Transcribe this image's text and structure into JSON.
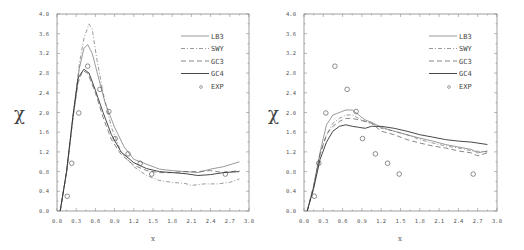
{
  "chart_data": [
    {
      "type": "line",
      "title": "",
      "xlabel": "x",
      "ylabel": "χ",
      "xlim": [
        0.0,
        3.0
      ],
      "ylim": [
        0.0,
        4.0
      ],
      "x_ticks": [
        "0.0",
        "0.3",
        "0.6",
        "0.9",
        "1.2",
        "1.5",
        "1.8",
        "2.1",
        "2.4",
        "2.7",
        "3.0"
      ],
      "y_ticks": [
        "0.0",
        "0.4",
        "0.8",
        "1.2",
        "1.6",
        "2.0",
        "2.4",
        "2.8",
        "3.2",
        "3.6",
        "4.0"
      ],
      "grid": false,
      "legend_position": "upper right",
      "series": [
        {
          "name": "LB3",
          "style": "solid-thin",
          "x": [
            0.05,
            0.15,
            0.25,
            0.35,
            0.42,
            0.48,
            0.55,
            0.65,
            0.75,
            0.9,
            1.05,
            1.2,
            1.4,
            1.6,
            1.8,
            2.0,
            2.2,
            2.4,
            2.6,
            2.85
          ],
          "y": [
            0.0,
            0.8,
            1.9,
            2.9,
            3.3,
            3.38,
            3.2,
            2.7,
            2.2,
            1.7,
            1.3,
            1.05,
            0.95,
            0.85,
            0.82,
            0.8,
            0.78,
            0.85,
            0.9,
            1.0
          ]
        },
        {
          "name": "SWY",
          "style": "dash-dot",
          "x": [
            0.05,
            0.15,
            0.25,
            0.35,
            0.42,
            0.5,
            0.55,
            0.62,
            0.72,
            0.85,
            1.0,
            1.2,
            1.4,
            1.6,
            1.8,
            2.0,
            2.1,
            2.3,
            2.5,
            2.7,
            2.85
          ],
          "y": [
            0.0,
            0.8,
            1.9,
            3.0,
            3.5,
            3.8,
            3.7,
            3.1,
            2.4,
            1.7,
            1.2,
            0.9,
            0.72,
            0.62,
            0.58,
            0.56,
            0.52,
            0.55,
            0.55,
            0.58,
            0.65
          ]
        },
        {
          "name": "GC3",
          "style": "dashed",
          "x": [
            0.05,
            0.15,
            0.25,
            0.33,
            0.4,
            0.48,
            0.6,
            0.72,
            0.85,
            1.0,
            1.2,
            1.4,
            1.6,
            1.8,
            2.0,
            2.2,
            2.4,
            2.6,
            2.85
          ],
          "y": [
            0.0,
            0.8,
            1.9,
            2.6,
            2.85,
            2.8,
            2.4,
            1.9,
            1.45,
            1.15,
            0.93,
            0.82,
            0.78,
            0.78,
            0.8,
            0.8,
            0.82,
            0.78,
            0.82
          ]
        },
        {
          "name": "GC4",
          "style": "solid",
          "x": [
            0.05,
            0.15,
            0.25,
            0.33,
            0.42,
            0.5,
            0.6,
            0.72,
            0.85,
            1.0,
            1.2,
            1.4,
            1.6,
            1.8,
            2.0,
            2.2,
            2.4,
            2.6,
            2.85
          ],
          "y": [
            0.0,
            0.8,
            1.95,
            2.7,
            2.88,
            2.8,
            2.45,
            2.0,
            1.55,
            1.2,
            0.98,
            0.86,
            0.8,
            0.78,
            0.76,
            0.72,
            0.74,
            0.78,
            0.8
          ]
        },
        {
          "name": "EXP",
          "style": "circle-marker",
          "x": [
            0.16,
            0.23,
            0.34,
            0.48,
            0.67,
            0.81,
            0.91,
            1.11,
            1.3,
            1.48,
            2.63
          ],
          "y": [
            0.3,
            0.97,
            1.99,
            2.94,
            2.47,
            2.02,
            1.47,
            1.16,
            0.97,
            0.75,
            0.75
          ]
        }
      ]
    },
    {
      "type": "line",
      "title": "",
      "xlabel": "x",
      "ylabel": "χ",
      "xlim": [
        0.0,
        3.0
      ],
      "ylim": [
        0.0,
        4.0
      ],
      "x_ticks": [
        "0.0",
        "0.3",
        "0.6",
        "0.9",
        "1.2",
        "1.5",
        "1.8",
        "2.1",
        "2.4",
        "2.7",
        "3.0"
      ],
      "y_ticks": [
        "0.0",
        "0.4",
        "0.8",
        "1.2",
        "1.6",
        "2.0",
        "2.4",
        "2.8",
        "3.2",
        "3.6",
        "4.0"
      ],
      "grid": false,
      "legend_position": "upper right",
      "series": [
        {
          "name": "LB3",
          "style": "solid-thin",
          "x": [
            0.05,
            0.15,
            0.25,
            0.35,
            0.45,
            0.55,
            0.65,
            0.75,
            0.85,
            0.95,
            1.05,
            1.2,
            1.4,
            1.6,
            1.8,
            2.0,
            2.2,
            2.4,
            2.6,
            2.7,
            2.85
          ],
          "y": [
            0.0,
            0.5,
            1.2,
            1.75,
            1.95,
            2.0,
            2.05,
            2.05,
            1.95,
            1.85,
            1.8,
            1.7,
            1.62,
            1.55,
            1.48,
            1.42,
            1.35,
            1.3,
            1.25,
            1.18,
            1.22
          ]
        },
        {
          "name": "SWY",
          "style": "dash-dot",
          "x": [
            0.05,
            0.15,
            0.25,
            0.35,
            0.45,
            0.55,
            0.65,
            0.75,
            0.85,
            0.95,
            1.05,
            1.2,
            1.4,
            1.6,
            1.8,
            2.0,
            2.2,
            2.4,
            2.6,
            2.85
          ],
          "y": [
            0.0,
            0.5,
            1.15,
            1.55,
            1.78,
            1.88,
            1.95,
            1.95,
            1.88,
            1.82,
            1.78,
            1.68,
            1.62,
            1.55,
            1.45,
            1.38,
            1.32,
            1.28,
            1.22,
            1.2
          ]
        },
        {
          "name": "GC3",
          "style": "dashed",
          "x": [
            0.05,
            0.15,
            0.25,
            0.35,
            0.45,
            0.55,
            0.65,
            0.75,
            0.85,
            0.95,
            1.05,
            1.2,
            1.4,
            1.6,
            1.8,
            2.0,
            2.2,
            2.4,
            2.6,
            2.7,
            2.85
          ],
          "y": [
            0.0,
            0.5,
            1.15,
            1.55,
            1.72,
            1.82,
            1.88,
            1.88,
            1.85,
            1.82,
            1.78,
            1.62,
            1.55,
            1.45,
            1.38,
            1.32,
            1.28,
            1.22,
            1.18,
            1.12,
            1.18
          ]
        },
        {
          "name": "GC4",
          "style": "solid",
          "x": [
            0.05,
            0.15,
            0.25,
            0.35,
            0.45,
            0.55,
            0.65,
            0.75,
            0.85,
            0.95,
            1.05,
            1.2,
            1.4,
            1.6,
            1.8,
            2.0,
            2.2,
            2.4,
            2.6,
            2.85
          ],
          "y": [
            0.0,
            0.45,
            1.05,
            1.4,
            1.62,
            1.72,
            1.75,
            1.72,
            1.7,
            1.68,
            1.72,
            1.72,
            1.68,
            1.62,
            1.55,
            1.5,
            1.45,
            1.42,
            1.4,
            1.35
          ]
        },
        {
          "name": "EXP",
          "style": "circle-marker",
          "x": [
            0.16,
            0.23,
            0.34,
            0.48,
            0.67,
            0.81,
            0.91,
            1.11,
            1.3,
            1.48,
            2.63
          ],
          "y": [
            0.3,
            0.97,
            1.99,
            2.94,
            2.47,
            2.02,
            1.47,
            1.16,
            0.97,
            0.75,
            0.75
          ]
        }
      ]
    }
  ],
  "panels": [
    {
      "ylabel": "χ",
      "xlabel": "x",
      "legend": [
        "LB3",
        "SWY",
        "GC3",
        "GC4",
        "EXP"
      ]
    },
    {
      "ylabel": "χ",
      "xlabel": "x",
      "legend": [
        "LB3",
        "SWY",
        "GC3",
        "GC4",
        "EXP"
      ]
    }
  ]
}
